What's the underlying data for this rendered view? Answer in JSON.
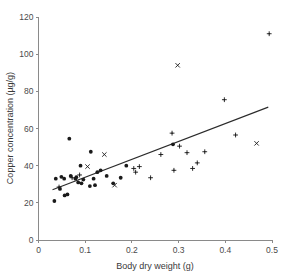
{
  "chart_data": {
    "type": "scatter",
    "title": "",
    "xlabel": "Body dry weight (g)",
    "ylabel": "Copper concentration (µg/g)",
    "xlim": [
      0,
      0.5
    ],
    "ylim": [
      0,
      120
    ],
    "xticks": [
      0,
      0.1,
      0.2,
      0.3,
      0.4,
      0.5
    ],
    "xtick_labels": [
      "0",
      "0.1",
      "0.2",
      "0.3",
      "0.4",
      "0.5"
    ],
    "yticks": [
      0,
      20,
      40,
      60,
      80,
      100,
      120
    ],
    "ytick_labels": [
      "0",
      "20",
      "40",
      "60",
      "80",
      "100",
      "120"
    ],
    "grid": false,
    "legend": false,
    "points": [
      {
        "x": 0.034,
        "y": 21.0,
        "marker": "dot"
      },
      {
        "x": 0.037,
        "y": 33.0,
        "marker": "dot"
      },
      {
        "x": 0.044,
        "y": 28.5,
        "marker": "cross"
      },
      {
        "x": 0.046,
        "y": 27.5,
        "marker": "dot"
      },
      {
        "x": 0.049,
        "y": 34.0,
        "marker": "dot"
      },
      {
        "x": 0.055,
        "y": 33.0,
        "marker": "dot"
      },
      {
        "x": 0.056,
        "y": 24.0,
        "marker": "dot"
      },
      {
        "x": 0.062,
        "y": 24.5,
        "marker": "dot"
      },
      {
        "x": 0.066,
        "y": 54.5,
        "marker": "dot"
      },
      {
        "x": 0.069,
        "y": 34.5,
        "marker": "dot"
      },
      {
        "x": 0.072,
        "y": 33.5,
        "marker": "cross"
      },
      {
        "x": 0.079,
        "y": 33.0,
        "marker": "dot"
      },
      {
        "x": 0.081,
        "y": 33.8,
        "marker": "dot"
      },
      {
        "x": 0.085,
        "y": 31.0,
        "marker": "dot"
      },
      {
        "x": 0.088,
        "y": 35.0,
        "marker": "cross"
      },
      {
        "x": 0.09,
        "y": 40.0,
        "marker": "dot"
      },
      {
        "x": 0.092,
        "y": 30.5,
        "marker": "dot"
      },
      {
        "x": 0.096,
        "y": 32.5,
        "marker": "dot"
      },
      {
        "x": 0.105,
        "y": 39.5,
        "marker": "x"
      },
      {
        "x": 0.11,
        "y": 29.0,
        "marker": "dot"
      },
      {
        "x": 0.112,
        "y": 47.5,
        "marker": "dot"
      },
      {
        "x": 0.118,
        "y": 33.0,
        "marker": "dot"
      },
      {
        "x": 0.121,
        "y": 29.5,
        "marker": "dot"
      },
      {
        "x": 0.126,
        "y": 36.5,
        "marker": "dot"
      },
      {
        "x": 0.133,
        "y": 37.5,
        "marker": "dot"
      },
      {
        "x": 0.141,
        "y": 46.0,
        "marker": "x"
      },
      {
        "x": 0.146,
        "y": 34.5,
        "marker": "dot"
      },
      {
        "x": 0.16,
        "y": 30.5,
        "marker": "dot"
      },
      {
        "x": 0.163,
        "y": 29.5,
        "marker": "x"
      },
      {
        "x": 0.176,
        "y": 33.5,
        "marker": "dot"
      },
      {
        "x": 0.188,
        "y": 40.0,
        "marker": "dot"
      },
      {
        "x": 0.204,
        "y": 38.5,
        "marker": "cross"
      },
      {
        "x": 0.208,
        "y": 36.5,
        "marker": "cross"
      },
      {
        "x": 0.216,
        "y": 39.5,
        "marker": "cross"
      },
      {
        "x": 0.24,
        "y": 33.5,
        "marker": "cross"
      },
      {
        "x": 0.262,
        "y": 46.0,
        "marker": "cross"
      },
      {
        "x": 0.286,
        "y": 57.5,
        "marker": "cross"
      },
      {
        "x": 0.288,
        "y": 51.5,
        "marker": "dot"
      },
      {
        "x": 0.29,
        "y": 37.5,
        "marker": "cross"
      },
      {
        "x": 0.298,
        "y": 94.0,
        "marker": "x"
      },
      {
        "x": 0.302,
        "y": 50.5,
        "marker": "cross"
      },
      {
        "x": 0.318,
        "y": 47.0,
        "marker": "cross"
      },
      {
        "x": 0.33,
        "y": 38.5,
        "marker": "cross"
      },
      {
        "x": 0.34,
        "y": 41.5,
        "marker": "cross"
      },
      {
        "x": 0.356,
        "y": 47.5,
        "marker": "cross"
      },
      {
        "x": 0.398,
        "y": 75.5,
        "marker": "cross"
      },
      {
        "x": 0.422,
        "y": 56.5,
        "marker": "cross"
      },
      {
        "x": 0.467,
        "y": 52.0,
        "marker": "x"
      },
      {
        "x": 0.494,
        "y": 111.0,
        "marker": "cross"
      }
    ],
    "fit_line": {
      "x_start": 0.03,
      "y_start": 27.0,
      "x_end": 0.492,
      "y_end": 71.5
    }
  }
}
